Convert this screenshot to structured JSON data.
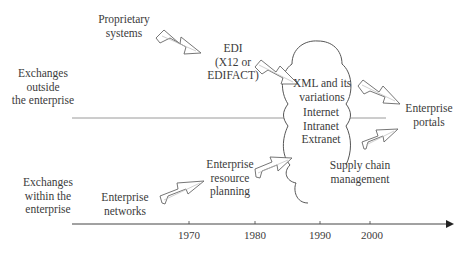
{
  "diagram": {
    "zones": {
      "outside": [
        "Exchanges",
        "outside",
        "the enterprise"
      ],
      "within": [
        "Exchanges",
        "within the",
        "enterprise"
      ]
    },
    "nodes": {
      "proprietary": [
        "Proprietary",
        "systems"
      ],
      "edi": [
        "EDI",
        "(X12 or",
        "EDIFACT)"
      ],
      "xml": [
        "XML and its",
        "variations"
      ],
      "networks": [
        "Internet",
        "Intranet",
        "Extranet"
      ],
      "supply_chain": [
        "Supply chain",
        "management"
      ],
      "portals": [
        "Enterprise",
        "portals"
      ],
      "erp": [
        "Enterprise",
        "resource",
        "planning"
      ],
      "enterprise_networks": [
        "Enterprise",
        "networks"
      ]
    },
    "timeline": {
      "ticks": [
        "1970",
        "1980",
        "1990",
        "2000"
      ]
    },
    "colors": {
      "line": "#555555",
      "text": "#3b3b3b",
      "arrow_fill": "#ffffff",
      "divider": "#999999"
    }
  }
}
